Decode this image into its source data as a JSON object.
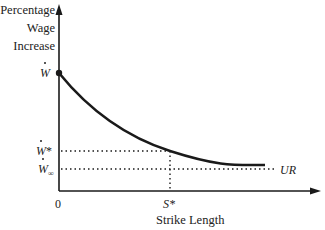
{
  "diagram": {
    "y_axis_label": [
      "Percentage",
      "Wage",
      "Increase"
    ],
    "x_axis_label": "Strike Length",
    "origin_label": "0",
    "y_ticks": {
      "w_dot": "W",
      "w_star": "W",
      "w_star_suffix": "*",
      "w_inf": "W",
      "w_inf_sub": "∞"
    },
    "x_ticks": {
      "s_star": "S*"
    },
    "curve_end_label": "UR",
    "colors": {
      "line": "#1a1a1a",
      "text": "#222222",
      "background": "#ffffff"
    }
  }
}
